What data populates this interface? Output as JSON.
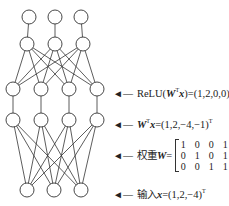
{
  "layers": {
    "top": [
      {
        "x": 29,
        "y": 17
      },
      {
        "x": 55,
        "y": 17
      },
      {
        "x": 81,
        "y": 17
      }
    ],
    "hidden2": [
      {
        "x": 27,
        "y": 44
      },
      {
        "x": 55,
        "y": 44
      },
      {
        "x": 83,
        "y": 44
      }
    ],
    "relu": [
      {
        "x": 13,
        "y": 89
      },
      {
        "x": 41,
        "y": 89
      },
      {
        "x": 69,
        "y": 89
      },
      {
        "x": 97,
        "y": 89
      }
    ],
    "linear": [
      {
        "x": 13,
        "y": 120
      },
      {
        "x": 41,
        "y": 120
      },
      {
        "x": 69,
        "y": 120
      },
      {
        "x": 97,
        "y": 120
      }
    ],
    "input": [
      {
        "x": 27,
        "y": 190
      },
      {
        "x": 54,
        "y": 190
      },
      {
        "x": 81,
        "y": 190
      }
    ]
  },
  "node_radius": 7,
  "line_color": "#333333",
  "labels": {
    "arrow": "◄—",
    "relu": {
      "prefix": "ReLU(",
      "W": "W",
      "T": "T",
      "x": "x",
      "suffix": ")=(1,2,0,0)",
      "sup": "T"
    },
    "linear": {
      "W": "W",
      "T": "T",
      "x": "x",
      "suffix": "=(1,2,−4,−1)",
      "sup": "T"
    },
    "weights": {
      "prefix": "权重",
      "W": "W",
      "eq": "=",
      "matrix": [
        [
          "1",
          "0",
          "0",
          "1"
        ],
        [
          "0",
          "1",
          "0",
          "1"
        ],
        [
          "0",
          "0",
          "1",
          "1"
        ]
      ]
    },
    "input": {
      "prefix": "输入",
      "x": "x",
      "suffix": "=(1,2,−4)",
      "sup": "T"
    }
  }
}
